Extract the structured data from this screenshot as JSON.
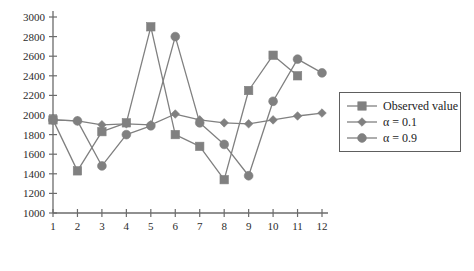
{
  "chart_data": {
    "type": "line",
    "title": "",
    "subtitle": "",
    "xlabel": "",
    "ylabel": "",
    "x": [
      1,
      2,
      3,
      4,
      5,
      6,
      7,
      8,
      9,
      10,
      11,
      12
    ],
    "xtick_labels": [
      "1",
      "2",
      "3",
      "4",
      "5",
      "6",
      "7",
      "8",
      "9",
      "10",
      "11",
      "12"
    ],
    "ytick_labels": [
      "1000",
      "1200",
      "1400",
      "1600",
      "1800",
      "2000",
      "2200",
      "2400",
      "2600",
      "2800",
      "3000"
    ],
    "ytick_values": [
      1000,
      1200,
      1400,
      1600,
      1800,
      2000,
      2200,
      2400,
      2600,
      2800,
      3000
    ],
    "xlim": [
      1,
      12
    ],
    "ylim": [
      1000,
      3000
    ],
    "grid": false,
    "legend_position": "right",
    "series": [
      {
        "name": "Observed value",
        "marker": "square",
        "color": "#808080",
        "x": [
          1,
          2,
          3,
          4,
          5,
          6,
          7,
          8,
          9,
          10,
          11
        ],
        "values": [
          1950,
          1430,
          1830,
          1920,
          2900,
          1800,
          1680,
          1340,
          2250,
          2610,
          2400
        ]
      },
      {
        "name": "α = 0.1",
        "marker": "diamond",
        "color": "#808080",
        "x": [
          1,
          2,
          3,
          4,
          5,
          6,
          7,
          8,
          9,
          10,
          11,
          12
        ],
        "values": [
          1950,
          1940,
          1900,
          1910,
          1900,
          2010,
          1950,
          1920,
          1910,
          1950,
          1990,
          2020
        ]
      },
      {
        "name": "α = 0.9",
        "marker": "circle",
        "color": "#808080",
        "x": [
          1,
          2,
          3,
          4,
          5,
          6,
          7,
          8,
          9,
          10,
          11,
          12
        ],
        "values": [
          1950,
          1940,
          1480,
          1800,
          1890,
          2800,
          1920,
          1700,
          1380,
          2140,
          2570,
          2430
        ]
      }
    ]
  },
  "legend": {
    "items": [
      {
        "label": "Observed value",
        "marker": "square"
      },
      {
        "label": "α = 0.1",
        "marker": "diamond"
      },
      {
        "label": "α = 0.9",
        "marker": "circle"
      }
    ]
  },
  "colors": {
    "series": "#808080",
    "axis": "#6b6b6b",
    "text": "#1c1c1c",
    "legend_border": "#5e5e5e",
    "background": "#ffffff"
  }
}
